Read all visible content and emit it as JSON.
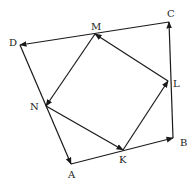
{
  "diagram": {
    "type": "vector-geometry",
    "colors": {
      "stroke": "#1a1a1a",
      "label": "#222222",
      "background": "#ffffff"
    },
    "points": [
      {
        "id": "A",
        "label": "A",
        "x": 71,
        "y": 164,
        "lx": 68,
        "ly": 178
      },
      {
        "id": "B",
        "label": "B",
        "x": 173,
        "y": 138,
        "lx": 180,
        "ly": 146
      },
      {
        "id": "C",
        "label": "C",
        "x": 169,
        "y": 22,
        "lx": 167,
        "ly": 17
      },
      {
        "id": "D",
        "label": "D",
        "x": 20,
        "y": 45,
        "lx": 9,
        "ly": 46
      },
      {
        "id": "K",
        "label": "K",
        "x": 123,
        "y": 150,
        "lx": 119,
        "ly": 163
      },
      {
        "id": "L",
        "label": "L",
        "x": 168,
        "y": 81,
        "lx": 173,
        "ly": 87
      },
      {
        "id": "M",
        "label": "M",
        "x": 95,
        "y": 34,
        "lx": 91,
        "ly": 30
      },
      {
        "id": "N",
        "label": "N",
        "x": 46,
        "y": 106,
        "lx": 30,
        "ly": 110
      }
    ],
    "vectors": [
      {
        "from": "D",
        "to": "A"
      },
      {
        "from": "A",
        "to": "B"
      },
      {
        "from": "B",
        "to": "C"
      },
      {
        "from": "C",
        "to": "D"
      },
      {
        "from": "M",
        "to": "N"
      },
      {
        "from": "N",
        "to": "K"
      },
      {
        "from": "K",
        "to": "L"
      },
      {
        "from": "L",
        "to": "M"
      }
    ]
  }
}
